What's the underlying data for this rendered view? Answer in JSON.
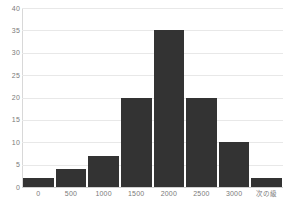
{
  "chart_data": {
    "type": "bar",
    "title": "",
    "subtitle": "",
    "xlabel": "",
    "ylabel": "",
    "categories": [
      "0",
      "500",
      "1000",
      "1500",
      "2000",
      "2500",
      "3000",
      "次の級"
    ],
    "values": [
      2,
      4,
      7,
      20,
      35,
      20,
      10,
      2
    ],
    "series": [
      {
        "name": "度数",
        "values": [
          2,
          4,
          7,
          20,
          35,
          20,
          10,
          2
        ]
      }
    ],
    "x_tick_labels": [
      "0",
      "500",
      "1000",
      "1500",
      "2000",
      "2500",
      "3000",
      "次の級"
    ],
    "y_tick_labels": [
      "0",
      "5",
      "10",
      "15",
      "20",
      "25",
      "30",
      "35",
      "40"
    ],
    "y_tick_values": [
      0,
      5,
      10,
      15,
      20,
      25,
      30,
      35,
      40
    ],
    "ylim": [
      0,
      40
    ],
    "grid": true,
    "grid_axis": "y",
    "legend": false,
    "legend_position": "none",
    "bar_color": "#333333",
    "grid_color": "#e8e8e8",
    "axis_label_color": "#7a7a7a",
    "background_color": "#ffffff"
  }
}
